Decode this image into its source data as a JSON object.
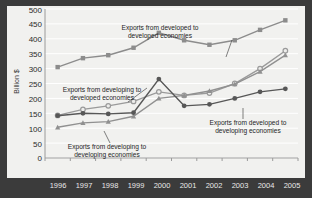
{
  "chart_data": {
    "type": "line",
    "title": "",
    "xlabel": "",
    "ylabel": "Billion $",
    "ylim": [
      0,
      500
    ],
    "ytick_step": 50,
    "grid": true,
    "legend": "annotations-inline",
    "x": [
      "1996",
      "1997",
      "1998",
      "1999",
      "2000",
      "2001",
      "2002",
      "2003",
      "2004",
      "2005"
    ],
    "yticks": [
      "0",
      "50",
      "100",
      "150",
      "200",
      "250",
      "300",
      "350",
      "400",
      "450",
      "500"
    ],
    "series": [
      {
        "name": "Exports from developed to developed economies",
        "marker": "square",
        "color": "#8c8c8c",
        "values": [
          305,
          335,
          345,
          370,
          420,
          395,
          380,
          395,
          430,
          462
        ]
      },
      {
        "name": "Exports from developing to developed economies",
        "marker": "circle-open",
        "color": "#9a9a9a",
        "values": [
          143,
          163,
          175,
          190,
          222,
          210,
          218,
          250,
          300,
          360
        ]
      },
      {
        "name": "Exports from developing to developing economies",
        "marker": "triangle",
        "color": "#909090",
        "values": [
          103,
          118,
          122,
          140,
          200,
          210,
          225,
          248,
          290,
          345
        ]
      },
      {
        "name": "Exports from developed to developing economies",
        "marker": "circle-filled",
        "color": "#575757",
        "values": [
          142,
          150,
          148,
          152,
          265,
          175,
          180,
          200,
          222,
          232
        ]
      }
    ],
    "annotations": [
      {
        "id": "anno-developed-developed",
        "line1": "Exports from developed to",
        "line2": "developed economies"
      },
      {
        "id": "anno-developing-developed",
        "line1": "Exports from developing to",
        "line2": "developed economies"
      },
      {
        "id": "anno-developing-developing",
        "line1": "Exports from developing to",
        "line2": "developing economies"
      },
      {
        "id": "anno-developed-developing",
        "line1": "Exports from developed to",
        "line2": "developing economies"
      }
    ],
    "colors": {
      "plot_background": "#f1f1ef",
      "frame": "#3b3b3b",
      "gridline": "#ffffff"
    }
  }
}
